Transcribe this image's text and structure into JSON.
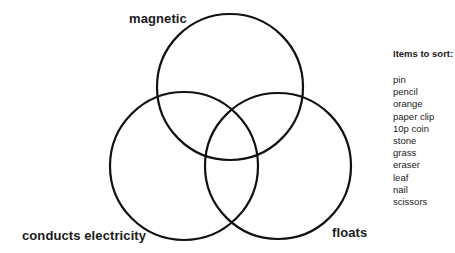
{
  "diagram": {
    "type": "venn",
    "sets": [
      {
        "id": "magnetic",
        "label": "magnetic",
        "cx": 230,
        "cy": 87,
        "r": 73
      },
      {
        "id": "conducts_electricity",
        "label": "conducts electricity",
        "cx": 184,
        "cy": 166,
        "r": 74
      },
      {
        "id": "floats",
        "label": "floats",
        "cx": 278,
        "cy": 166,
        "r": 73
      }
    ],
    "stroke_color": "#111111",
    "stroke_width": 2.2
  },
  "labels": {
    "magnetic": "magnetic",
    "conducts": "conducts electricity",
    "floats": "floats"
  },
  "items_panel": {
    "title": "Items to sort:",
    "items": [
      "pin",
      "pencil",
      "orange",
      "paper clip",
      "10p coin",
      "stone",
      "grass",
      "eraser",
      "leaf",
      "nail",
      "scissors"
    ]
  }
}
